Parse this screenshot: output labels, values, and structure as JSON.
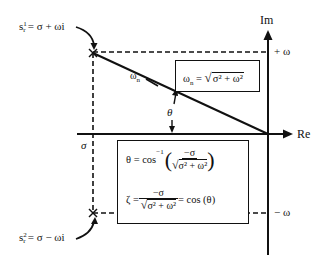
{
  "diagram": {
    "axes": {
      "imag_label": "Im",
      "real_label": "Re",
      "plus_omega": "+ ω",
      "minus_omega": "− ω",
      "sigma": "σ"
    },
    "poles": {
      "upper": {
        "label_s": "s",
        "label_sup": "1",
        "label_sub": "r",
        "label_rhs": "= σ + ωi"
      },
      "lower": {
        "label_s": "s",
        "label_sup": "2",
        "label_sub": "r",
        "label_rhs": "= σ − ωi"
      }
    },
    "vector_label": "ω",
    "vector_label_sub": "n",
    "angle_label": "θ",
    "omega_n_box": {
      "lhs": "ω",
      "lhs_sub": "n",
      "eq": " = ",
      "sqrt_content": "σ² + ω²"
    },
    "formula_box": {
      "theta_lhs": "θ = cos",
      "theta_sup": "−1",
      "theta_num": "−σ",
      "theta_den": "σ² + ω²",
      "zeta_lhs": "ζ = ",
      "zeta_num": "−σ",
      "zeta_den": "σ² + ω²",
      "zeta_rhs": " = cos (θ)"
    },
    "colors": {
      "line": "#111111",
      "background": "#ffffff"
    }
  }
}
